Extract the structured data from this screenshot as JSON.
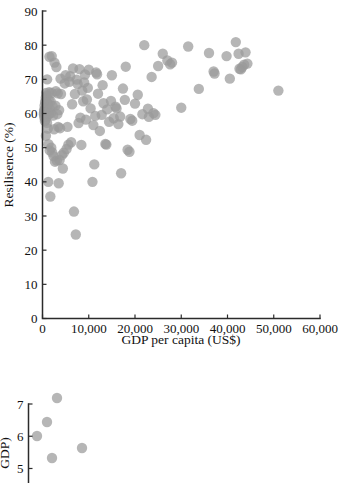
{
  "figure": {
    "background_color": "#ffffff",
    "marker_color": "#9a9a9a",
    "axis_color": "#2b2b2b"
  },
  "chart_data": [
    {
      "id": "resilience-vs-gdp",
      "type": "scatter",
      "title": "",
      "xlabel": "GDP per capita (US$)",
      "ylabel": "Resilisence (%)",
      "xlim": [
        0,
        60000
      ],
      "ylim": [
        0,
        90
      ],
      "xticks": [
        0,
        10000,
        20000,
        30000,
        40000,
        50000,
        60000
      ],
      "xticklabels": [
        "0",
        "10,000",
        "20,000",
        "30,000",
        "40,000",
        "50,000",
        "60,000"
      ],
      "yticks": [
        0,
        10,
        20,
        30,
        40,
        50,
        60,
        70,
        80,
        90
      ],
      "yticklabels": [
        "0",
        "10",
        "20",
        "30",
        "40",
        "50",
        "60",
        "70",
        "80",
        "90"
      ],
      "grid": false,
      "legend": null,
      "marker": {
        "shape": "circle",
        "color": "#9a9a9a",
        "opacity": 0.72,
        "size": 5.2
      },
      "points": [
        [
          300,
          59.8
        ],
        [
          320,
          60.2
        ],
        [
          340,
          61.0
        ],
        [
          380,
          58.9
        ],
        [
          420,
          60.5
        ],
        [
          450,
          62.3
        ],
        [
          480,
          59.4
        ],
        [
          520,
          57.8
        ],
        [
          560,
          63.4
        ],
        [
          600,
          60.0
        ],
        [
          640,
          61.4
        ],
        [
          680,
          58.2
        ],
        [
          700,
          64.6
        ],
        [
          740,
          53.5
        ],
        [
          780,
          66.0
        ],
        [
          820,
          60.9
        ],
        [
          860,
          62.0
        ],
        [
          900,
          59.1
        ],
        [
          940,
          65.2
        ],
        [
          980,
          57.3
        ],
        [
          1000,
          70.0
        ],
        [
          1050,
          63.0
        ],
        [
          1100,
          60.6
        ],
        [
          1150,
          55.6
        ],
        [
          1200,
          62.8
        ],
        [
          1250,
          40.0
        ],
        [
          1300,
          51.0
        ],
        [
          1350,
          64.0
        ],
        [
          1400,
          59.9
        ],
        [
          1450,
          66.2
        ],
        [
          1500,
          76.6
        ],
        [
          1550,
          49.2
        ],
        [
          1600,
          61.3
        ],
        [
          1700,
          35.7
        ],
        [
          1750,
          63.6
        ],
        [
          1800,
          60.1
        ],
        [
          1900,
          50.0
        ],
        [
          1950,
          66.0
        ],
        [
          2000,
          76.8
        ],
        [
          2100,
          48.6
        ],
        [
          2200,
          62.1
        ],
        [
          2300,
          59.4
        ],
        [
          2400,
          47.5
        ],
        [
          2500,
          55.4
        ],
        [
          2600,
          74.9
        ],
        [
          2700,
          45.9
        ],
        [
          2800,
          62.3
        ],
        [
          2900,
          66.5
        ],
        [
          3000,
          73.6
        ],
        [
          3100,
          46.2
        ],
        [
          3200,
          59.8
        ],
        [
          3300,
          65.9
        ],
        [
          3400,
          56.1
        ],
        [
          3500,
          39.6
        ],
        [
          3600,
          61.0
        ],
        [
          3700,
          46.4
        ],
        [
          3800,
          55.7
        ],
        [
          3900,
          70.2
        ],
        [
          4000,
          65.7
        ],
        [
          4200,
          47.8
        ],
        [
          4400,
          43.9
        ],
        [
          4600,
          48.5
        ],
        [
          4800,
          68.8
        ],
        [
          5000,
          71.2
        ],
        [
          5200,
          49.6
        ],
        [
          5400,
          56.1
        ],
        [
          5600,
          50.9
        ],
        [
          5800,
          69.3
        ],
        [
          6000,
          70.9
        ],
        [
          6200,
          51.6
        ],
        [
          6400,
          62.7
        ],
        [
          6600,
          73.2
        ],
        [
          6800,
          31.3
        ],
        [
          7000,
          65.7
        ],
        [
          7200,
          24.6
        ],
        [
          7400,
          69.9
        ],
        [
          7600,
          68.6
        ],
        [
          7800,
          57.2
        ],
        [
          8000,
          73.0
        ],
        [
          8200,
          58.8
        ],
        [
          8400,
          50.8
        ],
        [
          8600,
          66.7
        ],
        [
          8800,
          63.6
        ],
        [
          9000,
          69.1
        ],
        [
          9200,
          71.4
        ],
        [
          9400,
          58.2
        ],
        [
          9600,
          64.1
        ],
        [
          9800,
          67.5
        ],
        [
          10000,
          72.8
        ],
        [
          10400,
          61.5
        ],
        [
          10800,
          40.0
        ],
        [
          11000,
          56.6
        ],
        [
          11200,
          45.1
        ],
        [
          11400,
          59.3
        ],
        [
          11600,
          72.0
        ],
        [
          11800,
          71.5
        ],
        [
          12000,
          65.8
        ],
        [
          12400,
          54.9
        ],
        [
          12800,
          59.6
        ],
        [
          13000,
          68.3
        ],
        [
          13200,
          63.0
        ],
        [
          13600,
          51.1
        ],
        [
          13800,
          50.9
        ],
        [
          14000,
          61.2
        ],
        [
          14400,
          57.6
        ],
        [
          14800,
          63.7
        ],
        [
          15000,
          71.2
        ],
        [
          15400,
          58.6
        ],
        [
          15800,
          62.0
        ],
        [
          16000,
          61.5
        ],
        [
          16400,
          56.9
        ],
        [
          16800,
          59.1
        ],
        [
          17000,
          42.5
        ],
        [
          17400,
          67.3
        ],
        [
          17800,
          64.0
        ],
        [
          18000,
          73.7
        ],
        [
          18400,
          49.4
        ],
        [
          18800,
          48.8
        ],
        [
          19000,
          58.4
        ],
        [
          19400,
          57.9
        ],
        [
          20000,
          62.9
        ],
        [
          20600,
          65.5
        ],
        [
          21000,
          53.7
        ],
        [
          21600,
          59.8
        ],
        [
          22000,
          80.0
        ],
        [
          22400,
          52.3
        ],
        [
          22800,
          61.4
        ],
        [
          23000,
          59.0
        ],
        [
          23600,
          70.7
        ],
        [
          24000,
          60.1
        ],
        [
          24400,
          59.6
        ],
        [
          25000,
          73.9
        ],
        [
          26000,
          77.5
        ],
        [
          27000,
          75.5
        ],
        [
          27600,
          74.4
        ],
        [
          28000,
          74.9
        ],
        [
          30000,
          61.7
        ],
        [
          31500,
          79.6
        ],
        [
          33800,
          67.2
        ],
        [
          36000,
          77.7
        ],
        [
          37000,
          72.3
        ],
        [
          37200,
          71.7
        ],
        [
          39800,
          76.8
        ],
        [
          40500,
          70.2
        ],
        [
          41800,
          80.9
        ],
        [
          42400,
          77.5
        ],
        [
          42600,
          73.1
        ],
        [
          42900,
          72.9
        ],
        [
          43200,
          73.6
        ],
        [
          43600,
          74.3
        ],
        [
          43900,
          77.9
        ],
        [
          44300,
          74.6
        ],
        [
          51000,
          66.7
        ]
      ]
    },
    {
      "id": "gdp-secondary",
      "type": "scatter",
      "title": "",
      "xlabel": "",
      "ylabel": "GDP)",
      "ylim": [
        4.55,
        7.0
      ],
      "yticks": [
        5,
        6,
        7
      ],
      "yticklabels": [
        "5",
        "6",
        "7"
      ],
      "grid": false,
      "legend": null,
      "clipped": true,
      "marker": {
        "shape": "circle",
        "color": "#9a9a9a",
        "opacity": 0.72,
        "size": 5.2
      },
      "points_px": [
        [
          37,
          436
        ],
        [
          47,
          422
        ],
        [
          57,
          398
        ],
        [
          52,
          458
        ],
        [
          82,
          448
        ]
      ]
    }
  ]
}
